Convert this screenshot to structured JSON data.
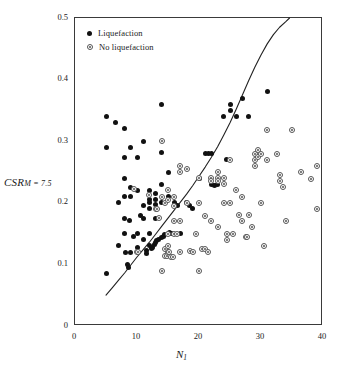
{
  "chart_data": {
    "type": "scatter",
    "title": "",
    "xlabel": "N_1",
    "xlabel_main": "N",
    "xlabel_sub": "1",
    "ylabel": "CSR_M=7.5",
    "ylabel_main": "CSR",
    "ylabel_sub": "M = 7.5",
    "xlim": [
      0,
      40
    ],
    "ylim": [
      0,
      0.5
    ],
    "xticks": [
      0,
      10,
      20,
      30,
      40
    ],
    "xtick_labels": [
      "0",
      "10",
      "20",
      "30",
      "40"
    ],
    "yticks": [
      0,
      0.1,
      0.2,
      0.3,
      0.4,
      0.5
    ],
    "ytick_labels": [
      "0",
      "0.1",
      "0.2",
      "0.3",
      "0.4",
      "0.5"
    ],
    "grid": false,
    "legend_position": "top-left",
    "legend": [
      {
        "label": "Liquefaction",
        "marker": "filled-circle",
        "color": "#111111"
      },
      {
        "label": "No liquefaction",
        "marker": "open-circle-dot",
        "color": "#555555"
      }
    ],
    "series": [
      {
        "name": "Liquefaction",
        "marker": "filled-circle",
        "points": [
          [
            5.0,
            0.34
          ],
          [
            5.0,
            0.29
          ],
          [
            5.0,
            0.085
          ],
          [
            6.5,
            0.33
          ],
          [
            7.0,
            0.2
          ],
          [
            7.0,
            0.13
          ],
          [
            8.0,
            0.32
          ],
          [
            8.0,
            0.273
          ],
          [
            8.0,
            0.24
          ],
          [
            8.0,
            0.21
          ],
          [
            8.0,
            0.175
          ],
          [
            8.0,
            0.15
          ],
          [
            8.2,
            0.12
          ],
          [
            8.5,
            0.1
          ],
          [
            8.7,
            0.095
          ],
          [
            8.8,
            0.172
          ],
          [
            9.0,
            0.29
          ],
          [
            9.0,
            0.225
          ],
          [
            9.0,
            0.21
          ],
          [
            9.0,
            0.12
          ],
          [
            9.5,
            0.145
          ],
          [
            10.0,
            0.273
          ],
          [
            10.0,
            0.22
          ],
          [
            10.0,
            0.15
          ],
          [
            10.0,
            0.127
          ],
          [
            10.5,
            0.18
          ],
          [
            11.0,
            0.3
          ],
          [
            11.0,
            0.195
          ],
          [
            11.0,
            0.175
          ],
          [
            11.0,
            0.14
          ],
          [
            11.5,
            0.122
          ],
          [
            11.5,
            0.118
          ],
          [
            12.0,
            0.22
          ],
          [
            12.0,
            0.205
          ],
          [
            12.0,
            0.2
          ],
          [
            12.0,
            0.19
          ],
          [
            12.0,
            0.15
          ],
          [
            12.0,
            0.13
          ],
          [
            12.3,
            0.126
          ],
          [
            12.5,
            0.128
          ],
          [
            12.8,
            0.132
          ],
          [
            13.0,
            0.215
          ],
          [
            13.0,
            0.205
          ],
          [
            13.0,
            0.198
          ],
          [
            13.0,
            0.175
          ],
          [
            13.0,
            0.135
          ],
          [
            13.2,
            0.138
          ],
          [
            13.5,
            0.14
          ],
          [
            14.0,
            0.36
          ],
          [
            14.0,
            0.282
          ],
          [
            14.0,
            0.23
          ],
          [
            14.0,
            0.2
          ],
          [
            14.0,
            0.143
          ],
          [
            14.3,
            0.146
          ],
          [
            14.5,
            0.148
          ],
          [
            15.0,
            0.25
          ],
          [
            15.0,
            0.21
          ],
          [
            15.0,
            0.15
          ],
          [
            15.2,
            0.152
          ],
          [
            15.5,
            0.15
          ],
          [
            16.0,
            0.2
          ],
          [
            16.5,
            0.195
          ],
          [
            17.0,
            0.15
          ],
          [
            18.0,
            0.2
          ],
          [
            18.5,
            0.195
          ],
          [
            19.0,
            0.19
          ],
          [
            20.0,
            0.24
          ],
          [
            21.0,
            0.28
          ],
          [
            21.5,
            0.28
          ],
          [
            22.0,
            0.28
          ],
          [
            22.0,
            0.23
          ],
          [
            22.5,
            0.228
          ],
          [
            23.0,
            0.23
          ],
          [
            24.0,
            0.34
          ],
          [
            24.5,
            0.27
          ],
          [
            25.0,
            0.36
          ],
          [
            25.0,
            0.35
          ],
          [
            26.0,
            0.34
          ],
          [
            27.0,
            0.37
          ],
          [
            28.0,
            0.34
          ],
          [
            31.0,
            0.38
          ]
        ]
      },
      {
        "name": "No liquefaction",
        "marker": "open-circle-dot",
        "points": [
          [
            9.5,
            0.222
          ],
          [
            10.0,
            0.12
          ],
          [
            10.2,
            0.12
          ],
          [
            12.0,
            0.213
          ],
          [
            13.0,
            0.19
          ],
          [
            13.2,
            0.19
          ],
          [
            13.5,
            0.175
          ],
          [
            14.0,
            0.09
          ],
          [
            14.0,
            0.3
          ],
          [
            14.0,
            0.21
          ],
          [
            14.5,
            0.2
          ],
          [
            14.5,
            0.125
          ],
          [
            14.5,
            0.113
          ],
          [
            14.8,
            0.113
          ],
          [
            15.0,
            0.22
          ],
          [
            15.0,
            0.205
          ],
          [
            15.0,
            0.15
          ],
          [
            15.0,
            0.13
          ],
          [
            15.0,
            0.12
          ],
          [
            15.2,
            0.12
          ],
          [
            15.5,
            0.112
          ],
          [
            15.8,
            0.112
          ],
          [
            16.0,
            0.21
          ],
          [
            16.0,
            0.195
          ],
          [
            16.0,
            0.17
          ],
          [
            16.0,
            0.15
          ],
          [
            16.5,
            0.15
          ],
          [
            17.0,
            0.26
          ],
          [
            17.0,
            0.25
          ],
          [
            17.0,
            0.17
          ],
          [
            17.0,
            0.12
          ],
          [
            18.0,
            0.255
          ],
          [
            18.0,
            0.2
          ],
          [
            18.5,
            0.122
          ],
          [
            19.0,
            0.12
          ],
          [
            19.5,
            0.15
          ],
          [
            20.0,
            0.24
          ],
          [
            20.0,
            0.2
          ],
          [
            20.0,
            0.09
          ],
          [
            20.5,
            0.125
          ],
          [
            21.0,
            0.178
          ],
          [
            21.0,
            0.125
          ],
          [
            21.5,
            0.12
          ],
          [
            22.0,
            0.24
          ],
          [
            22.0,
            0.235
          ],
          [
            22.0,
            0.17
          ],
          [
            23.0,
            0.25
          ],
          [
            23.0,
            0.24
          ],
          [
            23.0,
            0.235
          ],
          [
            23.0,
            0.16
          ],
          [
            24.0,
            0.24
          ],
          [
            24.0,
            0.23
          ],
          [
            24.0,
            0.2
          ],
          [
            24.5,
            0.15
          ],
          [
            24.5,
            0.14
          ],
          [
            25.0,
            0.27
          ],
          [
            25.0,
            0.2
          ],
          [
            25.5,
            0.15
          ],
          [
            26.0,
            0.22
          ],
          [
            26.5,
            0.18
          ],
          [
            27.0,
            0.21
          ],
          [
            27.0,
            0.17
          ],
          [
            27.5,
            0.145
          ],
          [
            27.8,
            0.145
          ],
          [
            28.0,
            0.18
          ],
          [
            28.5,
            0.16
          ],
          [
            29.0,
            0.28
          ],
          [
            29.0,
            0.27
          ],
          [
            29.0,
            0.26
          ],
          [
            29.5,
            0.285
          ],
          [
            29.5,
            0.275
          ],
          [
            30.0,
            0.28
          ],
          [
            30.0,
            0.2
          ],
          [
            30.5,
            0.13
          ],
          [
            31.0,
            0.318
          ],
          [
            31.0,
            0.27
          ],
          [
            32.5,
            0.28
          ],
          [
            33.0,
            0.245
          ],
          [
            33.0,
            0.235
          ],
          [
            33.5,
            0.225
          ],
          [
            34.0,
            0.17
          ],
          [
            35.0,
            0.318
          ],
          [
            36.5,
            0.25
          ],
          [
            38.0,
            0.238
          ],
          [
            39.0,
            0.26
          ],
          [
            39.0,
            0.19
          ]
        ]
      }
    ],
    "curve": {
      "name": "CRR boundary curve",
      "style": "solid",
      "color": "#222222",
      "points": [
        [
          5.0,
          0.05
        ],
        [
          6.0,
          0.062
        ],
        [
          7.0,
          0.074
        ],
        [
          8.0,
          0.086
        ],
        [
          9.0,
          0.099
        ],
        [
          10.0,
          0.112
        ],
        [
          11.0,
          0.124
        ],
        [
          12.0,
          0.136
        ],
        [
          13.0,
          0.149
        ],
        [
          14.0,
          0.162
        ],
        [
          15.0,
          0.175
        ],
        [
          16.0,
          0.188
        ],
        [
          17.0,
          0.201
        ],
        [
          18.0,
          0.214
        ],
        [
          19.0,
          0.228
        ],
        [
          20.0,
          0.243
        ],
        [
          21.0,
          0.258
        ],
        [
          22.0,
          0.274
        ],
        [
          23.0,
          0.291
        ],
        [
          24.0,
          0.31
        ],
        [
          25.0,
          0.33
        ],
        [
          26.0,
          0.352
        ],
        [
          27.0,
          0.375
        ],
        [
          28.0,
          0.398
        ],
        [
          29.0,
          0.42
        ],
        [
          30.0,
          0.44
        ],
        [
          31.0,
          0.458
        ],
        [
          32.0,
          0.473
        ],
        [
          33.0,
          0.485
        ],
        [
          34.0,
          0.494
        ],
        [
          34.6,
          0.5
        ]
      ]
    }
  }
}
